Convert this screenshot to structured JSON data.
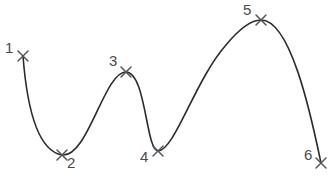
{
  "diagram": {
    "type": "smooth curve through numbered marker points",
    "stroke_color": "#2b2b2b",
    "marker_color": "#555555",
    "label_color": "#4a4a4a",
    "points": [
      {
        "label": "1",
        "x": 23,
        "y": 56,
        "label_x": 5,
        "label_y": 53
      },
      {
        "label": "2",
        "x": 62,
        "y": 155,
        "label_x": 67,
        "label_y": 168
      },
      {
        "label": "3",
        "x": 126,
        "y": 72,
        "label_x": 109,
        "label_y": 66
      },
      {
        "label": "4",
        "x": 158,
        "y": 151,
        "label_x": 140,
        "label_y": 162
      },
      {
        "label": "5",
        "x": 261,
        "y": 20,
        "label_x": 243,
        "label_y": 15
      },
      {
        "label": "6",
        "x": 321,
        "y": 163,
        "label_x": 304,
        "label_y": 160
      }
    ]
  }
}
